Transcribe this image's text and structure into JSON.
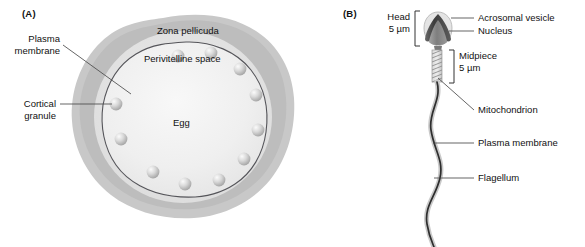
{
  "figure": {
    "panels": [
      {
        "tag": "(A)",
        "name": "egg-cross-section",
        "labels": {
          "zona_pellucida": "Zona pellicuda",
          "perivitelline_space": "Perivitelline space",
          "egg": "Egg",
          "plasma_membrane": "Plasma\nmembrane",
          "cortical_granule": "Cortical\ngranule"
        },
        "cortical_granule_count": 11
      },
      {
        "tag": "(B)",
        "name": "sperm-diagram",
        "labels": {
          "head": "Head\n5 µm",
          "midpiece": "Midpiece\n5 µm",
          "acrosomal_vesicle": "Acrosomal vesicle",
          "nucleus": "Nucleus",
          "mitochondrion": "Mitochondrion",
          "plasma_membrane": "Plasma membrane",
          "flagellum": "Flagellum"
        }
      }
    ]
  },
  "colors": {
    "background": "#ffffff",
    "text": "#111111",
    "zona_outer": "#c8c8c8",
    "zona_ring": "#bdbdbd",
    "perivitelline": "#e2e2e2",
    "egg_fill": "#efefef",
    "membrane_line": "#55555a",
    "granule_light": "#f3f3f3",
    "granule_mid": "#c9c9c9",
    "granule_dark": "#9b9b9b",
    "acrosome_dark": "#4a4a4a",
    "nucleus_gray": "#8e8e8e",
    "midpiece_gray": "#bfbfbf",
    "flagellum_dark": "#2e2e2e",
    "flagellum_halo": "#c9c9c9",
    "leader_line": "#4a4a4a"
  }
}
